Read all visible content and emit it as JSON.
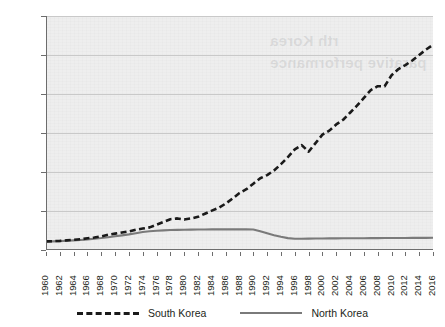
{
  "chart_data": {
    "type": "line",
    "title": "",
    "subtitle": "",
    "xlabel": "",
    "ylabel": "",
    "grid": true,
    "legend_position": "bottom",
    "xlim": [
      1960,
      2016
    ],
    "ylim": [
      0,
      30000
    ],
    "y_ticks": [
      0,
      5000,
      10000,
      15000,
      20000,
      25000,
      30000
    ],
    "y_tick_labels": [
      "0",
      "5 000",
      "10 000",
      "15 000",
      "20 000",
      "25 000",
      "30 000"
    ],
    "x_tick_labels": [
      "1960",
      "1962",
      "1964",
      "1966",
      "1968",
      "1970",
      "1972",
      "1974",
      "1976",
      "1978",
      "1980",
      "1982",
      "1984",
      "1986",
      "1988",
      "1990",
      "1992",
      "1994",
      "1996",
      "1998",
      "2000",
      "2002",
      "2004",
      "2006",
      "2008",
      "2010",
      "2012",
      "2014",
      "2016"
    ],
    "x": [
      1960,
      1961,
      1962,
      1963,
      1964,
      1965,
      1966,
      1967,
      1968,
      1969,
      1970,
      1971,
      1972,
      1973,
      1974,
      1975,
      1976,
      1977,
      1978,
      1979,
      1980,
      1981,
      1982,
      1983,
      1984,
      1985,
      1986,
      1987,
      1988,
      1989,
      1990,
      1991,
      1992,
      1993,
      1994,
      1995,
      1996,
      1997,
      1998,
      1999,
      2000,
      2001,
      2002,
      2003,
      2004,
      2005,
      2006,
      2007,
      2008,
      2009,
      2010,
      2011,
      2012,
      2013,
      2014,
      2015,
      2016
    ],
    "series": [
      {
        "name": "South Korea",
        "style": "dashed",
        "color": "#1a1a1a",
        "values": [
          1100,
          1130,
          1170,
          1240,
          1310,
          1380,
          1500,
          1600,
          1750,
          1950,
          2100,
          2250,
          2380,
          2600,
          2750,
          2900,
          3250,
          3600,
          3950,
          4050,
          3900,
          4050,
          4250,
          4650,
          5050,
          5400,
          5950,
          6600,
          7300,
          7800,
          8500,
          9200,
          9600,
          10200,
          11000,
          11900,
          12900,
          13450,
          12600,
          13700,
          14800,
          15300,
          16100,
          16700,
          17600,
          18500,
          19500,
          20500,
          21000,
          21000,
          22400,
          23200,
          23700,
          24300,
          25000,
          25700,
          26300
        ]
      },
      {
        "name": "North Korea",
        "style": "solid",
        "color": "#7a7a7a",
        "values": [
          1080,
          1110,
          1140,
          1180,
          1230,
          1290,
          1360,
          1440,
          1530,
          1640,
          1760,
          1880,
          2000,
          2150,
          2300,
          2400,
          2470,
          2520,
          2560,
          2580,
          2600,
          2610,
          2620,
          2630,
          2640,
          2640,
          2640,
          2640,
          2640,
          2640,
          2620,
          2400,
          2150,
          1900,
          1700,
          1520,
          1450,
          1450,
          1460,
          1470,
          1480,
          1490,
          1495,
          1500,
          1505,
          1510,
          1515,
          1520,
          1525,
          1530,
          1535,
          1540,
          1545,
          1550,
          1555,
          1560,
          1565
        ]
      }
    ]
  },
  "legend": {
    "items": [
      {
        "label": "South Korea",
        "style": "dashed"
      },
      {
        "label": "North Korea",
        "style": "solid"
      }
    ]
  },
  "watermark": {
    "line1": "rth Korea",
    "line2": "parative performance"
  },
  "colors": {
    "plot_background": "#eeeeee",
    "gridline": "#c9c9c9",
    "axis": "#6d6d6d",
    "text": "#231f20",
    "south_korea": "#1a1a1a",
    "north_korea": "#7a7a7a"
  }
}
